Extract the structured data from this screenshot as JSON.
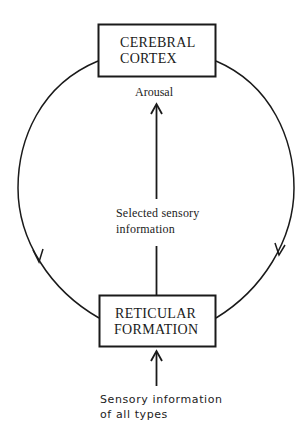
{
  "diagram": {
    "nodes": {
      "top": {
        "line1": "CEREBRAL",
        "line2": "CORTEX"
      },
      "bottom": {
        "line1": "RETICULAR",
        "line2": "FORMATION"
      }
    },
    "labels": {
      "arousal": "Arousal",
      "selected_line1": "Selected sensory",
      "selected_line2": "information",
      "input_line1": "Sensory information",
      "input_line2": "of all types"
    },
    "edges": [
      {
        "from": "RETICULAR FORMATION",
        "to": "CEREBRAL CORTEX",
        "label": "Selected sensory information / Arousal",
        "style": "straight-arrow"
      },
      {
        "from": "CEREBRAL CORTEX",
        "to": "RETICULAR FORMATION",
        "side": "left",
        "style": "curved-arrow"
      },
      {
        "from": "CEREBRAL CORTEX",
        "to": "RETICULAR FORMATION",
        "side": "right",
        "style": "curved-arrow"
      },
      {
        "from": "Sensory information of all types",
        "to": "RETICULAR FORMATION",
        "style": "straight-arrow"
      }
    ],
    "colors": {
      "line": "#1a1a1a",
      "background": "#ffffff"
    }
  }
}
